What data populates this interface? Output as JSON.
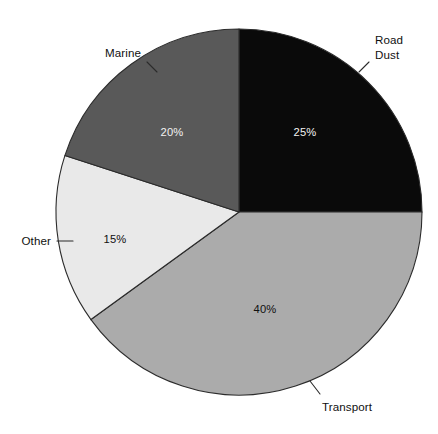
{
  "chart_data": {
    "type": "pie",
    "title": "",
    "subtitle": "",
    "xlabel": "",
    "ylabel": "",
    "legend_position": "none",
    "grid": false,
    "value_unit": "%",
    "start_angle_deg": 0,
    "direction": "clockwise",
    "categories": [
      "Road Dust",
      "Transport",
      "Other",
      "Marine"
    ],
    "values": [
      25,
      40,
      15,
      20
    ],
    "slices": [
      {
        "label": "Road Dust",
        "label_line1": "Road",
        "label_line2": "Dust",
        "value": 25,
        "value_label": "25%",
        "color": "#0a0a0a",
        "value_label_color": "#f2f2f2",
        "label_position": "outside-upper-right"
      },
      {
        "label": "Transport",
        "label_line1": "Transport",
        "label_line2": "",
        "value": 40,
        "value_label": "40%",
        "color": "#ababab",
        "value_label_color": "#101010",
        "label_position": "outside-bottom"
      },
      {
        "label": "Other",
        "label_line1": "Other",
        "label_line2": "",
        "value": 15,
        "value_label": "15%",
        "color": "#e9e9e9",
        "value_label_color": "#101010",
        "label_position": "outside-left"
      },
      {
        "label": "Marine",
        "label_line1": "Marine",
        "label_line2": "",
        "value": 20,
        "value_label": "20%",
        "color": "#595959",
        "value_label_color": "#f2f2f2",
        "label_position": "outside-upper-left"
      }
    ]
  },
  "colors": {
    "background": "#ffffff",
    "outline": "#2b2b2b",
    "road_dust": "#0a0a0a",
    "transport": "#ababab",
    "other": "#e9e9e9",
    "marine": "#595959",
    "text_dark": "#101010",
    "text_light": "#f2f2f2"
  },
  "values": {
    "road_dust_pct": "25%",
    "transport_pct": "40%",
    "other_pct": "15%",
    "marine_pct": "20%"
  },
  "labels": {
    "road_dust_line1": "Road",
    "road_dust_line2": "Dust",
    "transport": "Transport",
    "other": "Other",
    "marine": "Marine"
  }
}
